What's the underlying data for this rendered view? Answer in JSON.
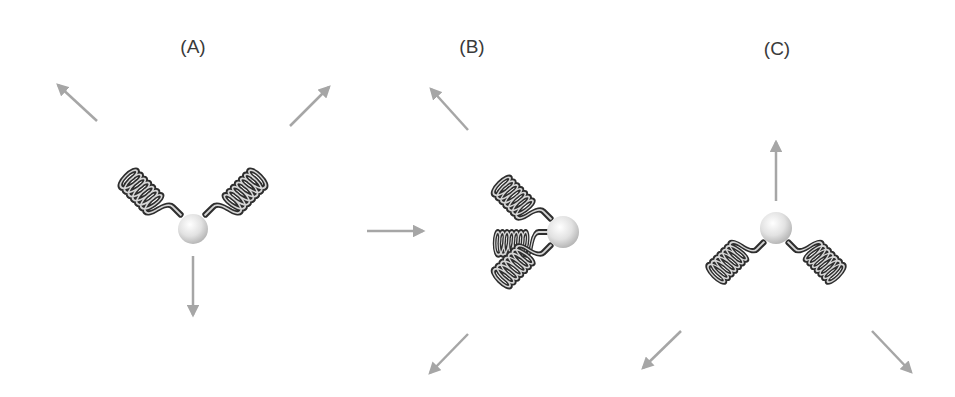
{
  "panels": [
    {
      "id": "A",
      "label": "(A)",
      "description": "Two springs pulling up-left and up-right, net force downward"
    },
    {
      "id": "B",
      "label": "(B)",
      "description": "Three springs on the left side of the ball: upper-left, left (pushed in), lower-left"
    },
    {
      "id": "C",
      "label": "(C)",
      "description": "Two springs pulling down-left and down-right, net force upward"
    }
  ],
  "colors": {
    "arrow": "#a6a6a6",
    "spring_dark": "#2e2e2e",
    "spring_light": "#d0d0d0",
    "ball_light": "#ffffff",
    "ball_dark": "#b5b5b5",
    "label": "#3a3a3a"
  },
  "icons": {
    "arrow": "arrow-icon",
    "spring": "spring-icon",
    "ball": "ball-icon"
  }
}
